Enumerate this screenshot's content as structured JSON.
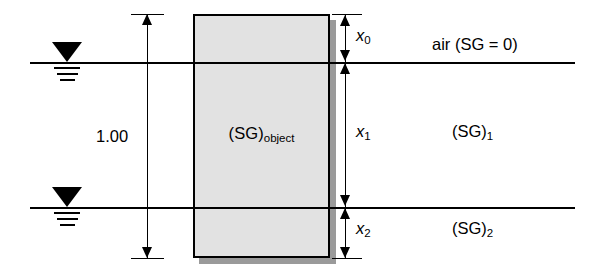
{
  "diagram": {
    "object": {
      "label_main": "(SG)",
      "label_sub": "object"
    },
    "dimensions": {
      "total": {
        "label": "1.00",
        "name": "total-height"
      },
      "segments": [
        {
          "label": "x",
          "sub": "0",
          "name": "x0-above-surface"
        },
        {
          "label": "x",
          "sub": "1",
          "name": "x1-in-fluid-1"
        },
        {
          "label": "x",
          "sub": "2",
          "name": "x2-in-fluid-2"
        }
      ]
    },
    "fluids": [
      {
        "main": "air (SG = 0)",
        "sub": "",
        "name": "air-layer"
      },
      {
        "main": "(SG)",
        "sub": "1",
        "name": "fluid-1-layer"
      },
      {
        "main": "(SG)",
        "sub": "2",
        "name": "fluid-2-layer"
      }
    ],
    "surfaces": [
      {
        "name": "upper-free-surface"
      },
      {
        "name": "lower-interface-surface"
      }
    ],
    "colors": {
      "object_fill": "#e2e2e2",
      "object_border": "#000000",
      "shadow": "#9a9a9a",
      "line": "#000000",
      "background": "#ffffff"
    }
  }
}
